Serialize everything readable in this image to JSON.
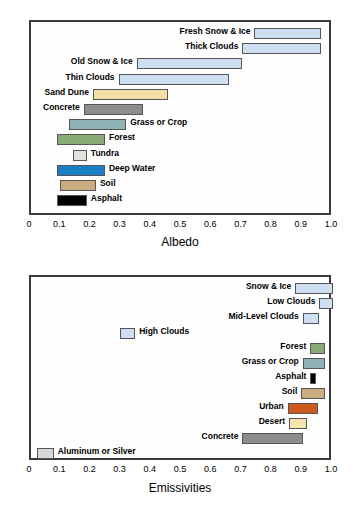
{
  "figure": {
    "charts": [
      {
        "id": "albedo",
        "axis_title": "Albedo",
        "ticks": [
          "0",
          "0.1",
          "0.2",
          "0.3",
          "0.4",
          "0.5",
          "0.6",
          "0.7",
          "0.8",
          "0.9",
          "1.0"
        ]
      },
      {
        "id": "emissivities",
        "axis_title": "Emissivities",
        "ticks": [
          "0",
          "0.1",
          "0.2",
          "0.3",
          "0.4",
          "0.5",
          "0.6",
          "0.7",
          "0.8",
          "0.9",
          "1.0"
        ]
      }
    ]
  },
  "chart_data": [
    {
      "type": "bar",
      "title": "",
      "xlabel": "Albedo",
      "ylabel": "",
      "xlim": [
        0,
        1.0
      ],
      "grid": false,
      "orientation": "horizontal",
      "legend": "none",
      "xticks": [
        0,
        0.1,
        0.2,
        0.3,
        0.4,
        0.5,
        0.6,
        0.7,
        0.8,
        0.9,
        1.0
      ],
      "categories": [
        "Fresh Snow & Ice",
        "Thick Clouds",
        "Old Snow & Ice",
        "Thin Clouds",
        "Sand Dune",
        "Concrete",
        "Grass or Crop",
        "Forest",
        "Tundra",
        "Deep Water",
        "Soil",
        "Asphalt"
      ],
      "ranges": [
        {
          "label": "Fresh Snow & Ice",
          "start": 0.74,
          "end": 0.96,
          "color": "#cddff0",
          "label_side": "left"
        },
        {
          "label": "Thick Clouds",
          "start": 0.7,
          "end": 0.96,
          "color": "#cddff0",
          "label_side": "left"
        },
        {
          "label": "Old Snow & Ice",
          "start": 0.35,
          "end": 0.7,
          "color": "#cddff0",
          "label_side": "left"
        },
        {
          "label": "Thin Clouds",
          "start": 0.29,
          "end": 0.655,
          "color": "#cddff0",
          "label_side": "left"
        },
        {
          "label": "Sand Dune",
          "start": 0.205,
          "end": 0.455,
          "color": "#f3dea8",
          "label_side": "left"
        },
        {
          "label": "Concrete",
          "start": 0.175,
          "end": 0.37,
          "color": "#8d8d8d",
          "label_side": "left"
        },
        {
          "label": "Grass or Crop",
          "start": 0.125,
          "end": 0.315,
          "color": "#8fb2b6",
          "label_side": "right"
        },
        {
          "label": "Forest",
          "start": 0.085,
          "end": 0.245,
          "color": "#8aab78",
          "label_side": "right"
        },
        {
          "label": "Tundra",
          "start": 0.14,
          "end": 0.185,
          "color": "#dfe2df",
          "label_side": "right"
        },
        {
          "label": "Deep Water",
          "start": 0.085,
          "end": 0.245,
          "color": "#1a7fc4",
          "label_side": "right"
        },
        {
          "label": "Soil",
          "start": 0.095,
          "end": 0.215,
          "color": "#cbab80",
          "label_side": "right"
        },
        {
          "label": "Asphalt",
          "start": 0.085,
          "end": 0.185,
          "color": "#000000",
          "label_side": "right"
        }
      ]
    },
    {
      "type": "bar",
      "title": "",
      "xlabel": "Emissivities",
      "ylabel": "",
      "xlim": [
        0,
        1.0
      ],
      "grid": false,
      "orientation": "horizontal",
      "legend": "none",
      "xticks": [
        0,
        0.1,
        0.2,
        0.3,
        0.4,
        0.5,
        0.6,
        0.7,
        0.8,
        0.9,
        1.0
      ],
      "categories": [
        "Snow & Ice",
        "Low Clouds",
        "Mid-Level Clouds",
        "High Clouds",
        "Forest",
        "Grass or Crop",
        "Asphalt",
        "Soil",
        "Urban",
        "Desert",
        "Concrete",
        "Aluminum or Silver"
      ],
      "ranges": [
        {
          "label": "Snow & Ice",
          "start": 0.875,
          "end": 1.0,
          "color": "#cddff0",
          "label_side": "left"
        },
        {
          "label": "Low Clouds",
          "start": 0.955,
          "end": 1.0,
          "color": "#cddff0",
          "label_side": "left"
        },
        {
          "label": "Mid-Level Clouds",
          "start": 0.9,
          "end": 0.955,
          "color": "#cddff0",
          "label_side": "left"
        },
        {
          "label": "High Clouds",
          "start": 0.295,
          "end": 0.345,
          "color": "#cddff0",
          "label_side": "right"
        },
        {
          "label": "Forest",
          "start": 0.925,
          "end": 0.975,
          "color": "#8aab78",
          "label_side": "left"
        },
        {
          "label": "Grass or Crop",
          "start": 0.9,
          "end": 0.975,
          "color": "#8fb2b6",
          "label_side": "left"
        },
        {
          "label": "Asphalt",
          "start": 0.925,
          "end": 0.945,
          "color": "#000000",
          "label_side": "left"
        },
        {
          "label": "Soil",
          "start": 0.895,
          "end": 0.975,
          "color": "#cbab80",
          "label_side": "left"
        },
        {
          "label": "Urban",
          "start": 0.85,
          "end": 0.95,
          "color": "#cc5a1e",
          "label_side": "left"
        },
        {
          "label": "Desert",
          "start": 0.855,
          "end": 0.915,
          "color": "#f5e3b0",
          "label_side": "left"
        },
        {
          "label": "Concrete",
          "start": 0.7,
          "end": 0.9,
          "color": "#8d8d8d",
          "label_side": "left"
        },
        {
          "label": "Aluminum or Silver",
          "start": 0.02,
          "end": 0.075,
          "color": "#d8d8d8",
          "label_side": "right"
        }
      ]
    }
  ]
}
